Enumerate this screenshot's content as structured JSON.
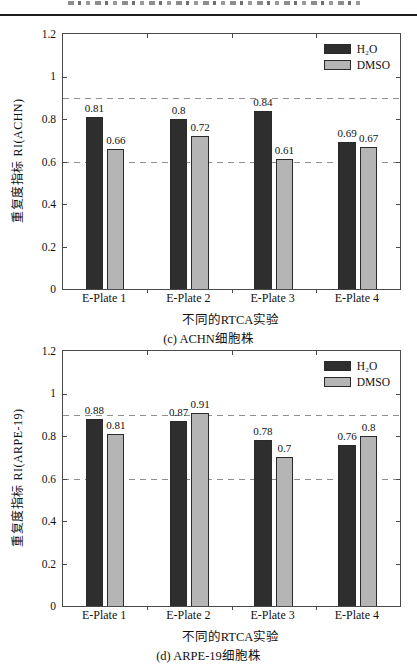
{
  "legend": {
    "h2o": "H₂O",
    "dmso": "DMSO"
  },
  "colors": {
    "h2o_bar": "#2e2e2e",
    "dmso_bar": "#b5b5b5",
    "bar_edge": "#2a2a2a",
    "dashed_line": "#8f8f8f",
    "axis": "#4a4a4a"
  },
  "chart_data": [
    {
      "type": "bar",
      "title": "(c) ACHN细胞株",
      "categories": [
        "E-Plate 1",
        "E-Plate 2",
        "E-Plate 3",
        "E-Plate 4"
      ],
      "series": [
        {
          "name": "H₂O",
          "color": "#2e2e2e",
          "values": [
            0.81,
            0.8,
            0.84,
            0.69
          ],
          "labels": [
            "0.81",
            "0.8",
            "0.84",
            "0.69"
          ]
        },
        {
          "name": "DMSO",
          "color": "#b5b5b5",
          "values": [
            0.66,
            0.72,
            0.61,
            0.67
          ],
          "labels": [
            "0.66",
            "0.72",
            "0.61",
            "0.67"
          ]
        }
      ],
      "xlabel": "不同的RTCA实验",
      "ylabel": "重复度指标 RI(ACHN)",
      "ylim": [
        0,
        1.2
      ],
      "y_ticks": [
        "0",
        "0.2",
        "0.4",
        "0.6",
        "0.8",
        "1",
        "1.2"
      ],
      "reference_lines": [
        0.9,
        0.6
      ],
      "grid": false,
      "legend_position": "top-right"
    },
    {
      "type": "bar",
      "title": "(d) ARPE-19细胞株",
      "categories": [
        "E-Plate 1",
        "E-Plate 2",
        "E-Plate 3",
        "E-Plate 4"
      ],
      "series": [
        {
          "name": "H₂O",
          "color": "#2e2e2e",
          "values": [
            0.88,
            0.87,
            0.78,
            0.76
          ],
          "labels": [
            "0.88",
            "0.87",
            "0.78",
            "0.76"
          ]
        },
        {
          "name": "DMSO",
          "color": "#b5b5b5",
          "values": [
            0.81,
            0.91,
            0.7,
            0.8
          ],
          "labels": [
            "0.81",
            "0.91",
            "0.7",
            "0.8"
          ]
        }
      ],
      "xlabel": "不同的RTCA实验",
      "ylabel": "重复度指标 RI(ARPE-19)",
      "ylim": [
        0,
        1.2
      ],
      "y_ticks": [
        "0",
        "0.2",
        "0.4",
        "0.6",
        "0.8",
        "1",
        "1.2"
      ],
      "reference_lines": [
        0.9,
        0.6
      ],
      "grid": false,
      "legend_position": "top-right"
    }
  ]
}
